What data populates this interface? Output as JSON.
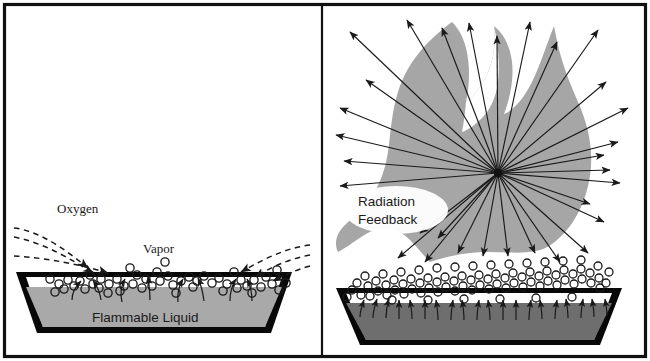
{
  "figure": {
    "border_color": "#111111",
    "background_color": "#ffffff"
  },
  "panels": [
    {
      "id": "left-panel",
      "name": "pre-ignition-panel",
      "labels": [
        {
          "id": "oxygen",
          "text": "Oxygen",
          "x": 57,
          "y": 213,
          "style": "serif"
        },
        {
          "id": "vapor",
          "text": "Vapor",
          "x": 143,
          "y": 253,
          "style": "serif"
        },
        {
          "id": "flammable-liquid",
          "text": "Flammable Liquid",
          "x": 92,
          "y": 322,
          "style": "sans"
        }
      ],
      "pan": {
        "wall_color": "#080808",
        "liquid_color": "#a9a9a9",
        "vapor_space_color": "#ffffff"
      },
      "counts": {
        "vapor_bubbles": 62,
        "oxygen_dashed_arrows": 4,
        "vapor_rise_arrows": 8
      }
    },
    {
      "id": "right-panel",
      "name": "burning-panel",
      "labels": [
        {
          "id": "radiation",
          "text": "Radiation",
          "x": 358,
          "y": 205,
          "style": "sans"
        },
        {
          "id": "feedback",
          "text": "Feedback",
          "x": 358,
          "y": 222,
          "style": "sans"
        }
      ],
      "flame": {
        "color": "#a6a6a6"
      },
      "pan": {
        "wall_color": "#080808",
        "liquid_color": "#6e6e6e",
        "vapor_space_color": "#ffffff"
      },
      "radiation": {
        "origin_x": 498,
        "origin_y": 173,
        "ray_count": 31,
        "arrow_color": "#1a1a1a"
      },
      "counts": {
        "vapor_bubbles": 118,
        "vapor_rise_arrows": 20
      }
    }
  ],
  "colors": {
    "ink": "#111111",
    "flame_gray": "#a6a6a6",
    "liquid_light": "#a9a9a9",
    "liquid_dark": "#6e6e6e",
    "pan_black": "#080808"
  }
}
